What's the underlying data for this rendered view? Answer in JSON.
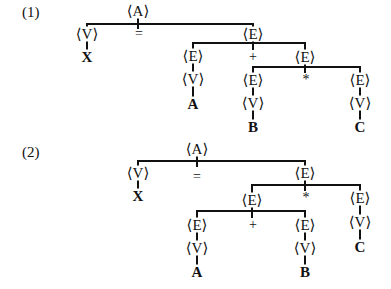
{
  "figures": [
    {
      "label": "(1)",
      "expression": "X = A + B * C",
      "nodes": {
        "root": "⟨A⟩",
        "lhs_v": "⟨V⟩",
        "lhs_leaf": "X",
        "assign_op": "=",
        "rhs_e": "⟨E⟩",
        "e_left": "⟨E⟩",
        "e_left_v": "⟨V⟩",
        "e_left_leaf": "A",
        "plus_op": "+",
        "e_right": "⟨E⟩",
        "e_rl": "⟨E⟩",
        "e_rl_v": "⟨V⟩",
        "e_rl_leaf": "B",
        "times_op": "*",
        "e_rr": "⟨E⟩",
        "e_rr_v": "⟨V⟩",
        "e_rr_leaf": "C"
      }
    },
    {
      "label": "(2)",
      "expression": "X = (A + B) * C",
      "nodes": {
        "root": "⟨A⟩",
        "lhs_v": "⟨V⟩",
        "lhs_leaf": "X",
        "assign_op": "=",
        "rhs_e": "⟨E⟩",
        "e_left": "⟨E⟩",
        "e_ll": "⟨E⟩",
        "e_ll_v": "⟨V⟩",
        "e_ll_leaf": "A",
        "plus_op": "+",
        "e_lr": "⟨E⟩",
        "e_lr_v": "⟨V⟩",
        "e_lr_leaf": "B",
        "times_op": "*",
        "e_right": "⟨E⟩",
        "e_right_v": "⟨V⟩",
        "e_right_leaf": "C"
      }
    }
  ]
}
